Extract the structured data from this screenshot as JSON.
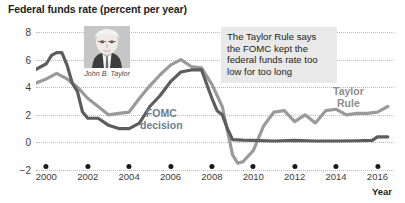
{
  "chart_data": {
    "type": "line",
    "title": "Federal funds rate (percent per year)",
    "xlabel": "Year",
    "ylabel": "",
    "xlim": [
      1999.5,
      2016.8
    ],
    "ylim": [
      -2,
      8
    ],
    "grid": true,
    "legend_position": "inline-annotations",
    "yticks": [
      8,
      6,
      4,
      2,
      0,
      -2
    ],
    "xticks": [
      2000,
      2002,
      2004,
      2006,
      2008,
      2010,
      2012,
      2014,
      2016
    ],
    "series": [
      {
        "name": "FOMC decision",
        "color": "#5d5d5d",
        "x": [
          1999.5,
          2000.0,
          2000.25,
          2000.5,
          2000.75,
          2001.0,
          2001.25,
          2001.5,
          2001.75,
          2002.0,
          2002.5,
          2003.0,
          2003.5,
          2004.0,
          2004.5,
          2005.0,
          2005.5,
          2006.0,
          2006.5,
          2007.0,
          2007.5,
          2008.0,
          2008.25,
          2008.5,
          2008.75,
          2009.0,
          2009.5,
          2010.0,
          2011.0,
          2012.0,
          2013.0,
          2014.0,
          2015.0,
          2015.75,
          2016.0,
          2016.5
        ],
        "values": [
          5.3,
          5.7,
          6.3,
          6.5,
          6.5,
          5.6,
          4.3,
          3.7,
          2.2,
          1.75,
          1.75,
          1.25,
          1.0,
          1.0,
          1.4,
          2.6,
          3.4,
          4.4,
          5.1,
          5.25,
          5.25,
          3.2,
          2.3,
          2.0,
          1.0,
          0.2,
          0.16,
          0.15,
          0.1,
          0.15,
          0.1,
          0.1,
          0.12,
          0.15,
          0.4,
          0.4
        ]
      },
      {
        "name": "Taylor Rule",
        "color": "#9a9a9a",
        "x": [
          1999.5,
          2000.0,
          2000.5,
          2001.0,
          2001.5,
          2002.0,
          2002.5,
          2003.0,
          2003.5,
          2004.0,
          2004.5,
          2005.0,
          2005.5,
          2006.0,
          2006.5,
          2007.0,
          2007.5,
          2008.0,
          2008.5,
          2009.0,
          2009.25,
          2009.5,
          2010.0,
          2010.5,
          2011.0,
          2011.5,
          2012.0,
          2012.5,
          2013.0,
          2013.5,
          2014.0,
          2014.5,
          2015.0,
          2015.5,
          2016.0,
          2016.5
        ],
        "values": [
          4.3,
          4.6,
          5.0,
          4.6,
          4.0,
          3.2,
          2.6,
          2.0,
          2.1,
          2.2,
          3.2,
          4.1,
          4.9,
          5.6,
          6.0,
          5.5,
          5.4,
          4.2,
          2.6,
          -0.9,
          -1.5,
          -1.4,
          -0.6,
          1.2,
          2.2,
          2.3,
          1.5,
          2.0,
          1.4,
          2.3,
          2.4,
          2.0,
          2.1,
          2.1,
          2.2,
          2.6
        ]
      }
    ],
    "annotations": [
      {
        "name": "taylor-rule-callout",
        "text": "The Taylor Rule says the FOMC kept the federal funds rate too low for too long"
      },
      {
        "name": "photo-caption",
        "text": "John B. Taylor"
      }
    ],
    "series_labels": {
      "fomc_line1": "FOMC",
      "fomc_line2": "decision",
      "taylor_line1": "Taylor",
      "taylor_line2": "Rule"
    }
  }
}
